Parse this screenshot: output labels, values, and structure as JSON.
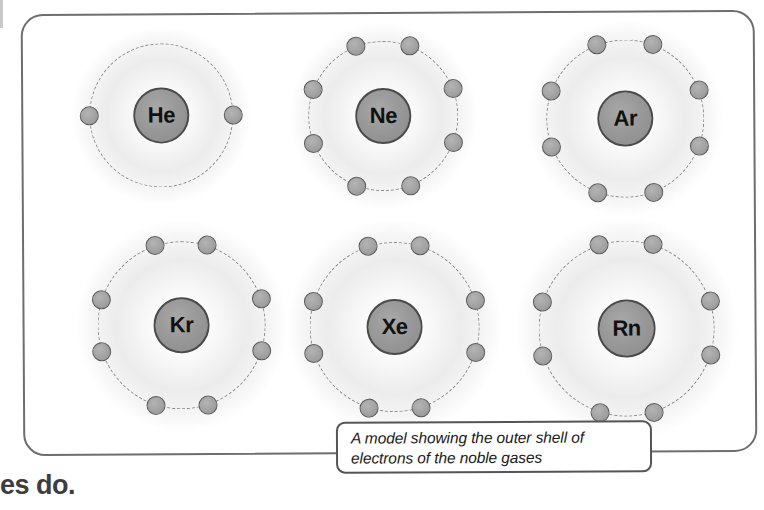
{
  "panel": {
    "border_color": "#6e6e6e",
    "background": "#ffffff"
  },
  "colors": {
    "nucleus_fill": "#999999",
    "nucleus_stroke": "#4a4a4a",
    "electron_fill": "#a2a2a2",
    "electron_stroke": "#5a5a5a",
    "shell_stroke": "#8a8a8a",
    "caption_border": "#555555",
    "label_text": "#111111"
  },
  "chart_data": {
    "type": "diagram",
    "title": "A model showing the outer shell of electrons of the noble gases",
    "subtitle": "",
    "xlabel": "",
    "ylabel": "",
    "legend": [],
    "grid": false,
    "categories": [
      "He",
      "Ne",
      "Ar",
      "Kr",
      "Xe",
      "Rn"
    ],
    "values": [
      2,
      8,
      8,
      8,
      8,
      8
    ],
    "series": [
      {
        "name": "outer shell electrons",
        "values": [
          2,
          8,
          8,
          8,
          8,
          8
        ]
      }
    ]
  },
  "atoms": [
    {
      "symbol": "He",
      "electron_count": 2,
      "cx": 140,
      "cy": 102,
      "shell_rx": 72,
      "shell_ry": 72,
      "nucleus_r": 28,
      "halo_r": 76,
      "electron_angles": [
        180,
        0
      ]
    },
    {
      "symbol": "Ne",
      "electron_count": 8,
      "cx": 362,
      "cy": 104,
      "shell_rx": 75,
      "shell_ry": 75,
      "nucleus_r": 28,
      "halo_r": 80,
      "electron_angles": [
        249,
        291,
        339,
        21,
        69,
        111,
        159,
        201
      ]
    },
    {
      "symbol": "Ar",
      "electron_count": 8,
      "cx": 604,
      "cy": 108,
      "shell_rx": 79,
      "shell_ry": 79,
      "nucleus_r": 28,
      "halo_r": 84,
      "electron_angles": [
        249,
        291,
        339,
        21,
        69,
        111,
        159,
        201
      ]
    },
    {
      "symbol": "Kr",
      "electron_count": 8,
      "cx": 159,
      "cy": 312,
      "shell_rx": 84,
      "shell_ry": 84,
      "nucleus_r": 28,
      "halo_r": 90,
      "electron_angles": [
        252,
        288,
        342,
        18,
        72,
        108,
        162,
        198
      ]
    },
    {
      "symbol": "Xe",
      "electron_count": 8,
      "cx": 372,
      "cy": 315,
      "shell_rx": 85,
      "shell_ry": 85,
      "nucleus_r": 28,
      "halo_r": 92,
      "electron_angles": [
        252,
        288,
        342,
        18,
        72,
        108,
        162,
        198
      ]
    },
    {
      "symbol": "Rn",
      "electron_count": 8,
      "cx": 604,
      "cy": 318,
      "shell_rx": 88,
      "shell_ry": 88,
      "nucleus_r": 29,
      "halo_r": 95,
      "electron_angles": [
        252,
        288,
        342,
        18,
        72,
        108,
        162,
        198
      ]
    }
  ],
  "caption": {
    "line1": "A model showing the outer shell of",
    "line2": "electrons of the noble gases",
    "full_text": "A model showing the outer shell of electrons of the noble gases"
  },
  "page_fragment": {
    "text": "es do."
  }
}
